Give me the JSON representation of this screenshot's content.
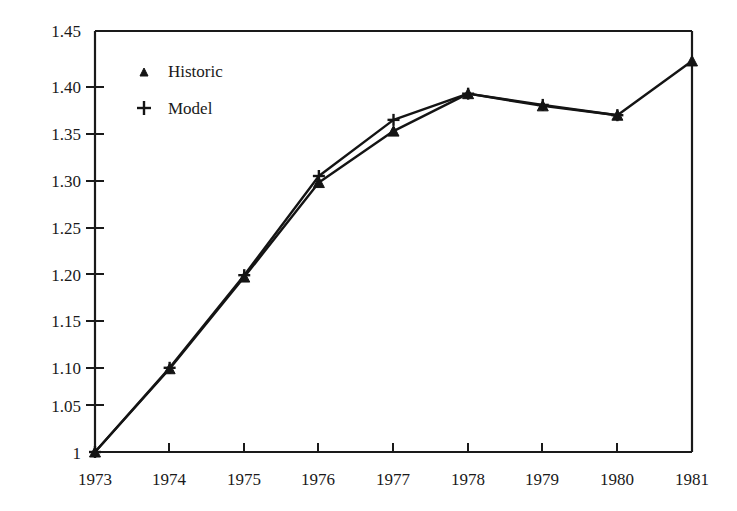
{
  "chart_data": {
    "type": "line",
    "title": "",
    "xlabel": "",
    "ylabel": "",
    "x": [
      1973,
      1974,
      1975,
      1976,
      1977,
      1978,
      1979,
      1980,
      1981
    ],
    "categories": [
      "1973",
      "1974",
      "1975",
      "1976",
      "1977",
      "1978",
      "1979",
      "1980",
      "1981"
    ],
    "xlim": [
      1973,
      1981
    ],
    "ylim": [
      1.0,
      1.45
    ],
    "yticks": [
      1.0,
      1.05,
      1.1,
      1.15,
      1.2,
      1.25,
      1.3,
      1.35,
      1.4,
      1.45
    ],
    "ytick_labels": [
      "1",
      "1.05",
      "1.10",
      "1.15",
      "1.20",
      "1.25",
      "1.30",
      "1.35",
      "1.40",
      "1.45"
    ],
    "xtick_labels": [
      "1973",
      "1974",
      "1975",
      "1976",
      "1977",
      "1978",
      "1979",
      "1980",
      "1981"
    ],
    "grid": false,
    "legend_position": "upper-left-inside",
    "series": [
      {
        "name": "Historic",
        "marker": "triangle",
        "color": "#141414",
        "x": [
          1973,
          1974,
          1975,
          1976,
          1977,
          1978,
          1979,
          1980,
          1981
        ],
        "values": [
          1.0,
          1.089,
          1.187,
          1.288,
          1.343,
          1.383,
          1.37,
          1.36,
          1.418
        ]
      },
      {
        "name": "Model",
        "marker": "plus",
        "color": "#141414",
        "x": [
          1973,
          1974,
          1975,
          1976,
          1977,
          1978,
          1979,
          1980
        ],
        "values": [
          1.0,
          1.09,
          1.189,
          1.295,
          1.355,
          1.383,
          1.371,
          1.36
        ]
      }
    ],
    "legend": [
      {
        "label": "Historic",
        "marker": "triangle"
      },
      {
        "label": "Model",
        "marker": "plus"
      }
    ]
  },
  "axis": {
    "y_tick_labels": [
      "1.45",
      "1.40",
      "1.35",
      "1.30",
      "1.25",
      "1.20",
      "1.15",
      "1.10",
      "1.05",
      "1"
    ],
    "x_tick_labels": [
      "1973",
      "1974",
      "1975",
      "1976",
      "1977",
      "1978",
      "1979",
      "1980",
      "1981"
    ]
  },
  "legend": {
    "historic_label": "Historic",
    "model_label": "Model"
  },
  "colors": {
    "ink": "#141414",
    "background": "#ffffff"
  }
}
